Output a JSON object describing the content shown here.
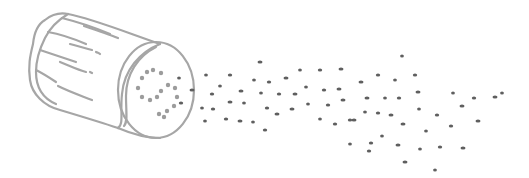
{
  "illustration": {
    "subject": "salt shaker sprinkling",
    "width": 529,
    "height": 178,
    "colors": {
      "background": "#ffffff",
      "outline": "#a6a6a6",
      "holes": "#9c9c9c",
      "grains": "#5f5f5f"
    }
  },
  "shaker": {
    "cap_center": [
      155,
      88
    ],
    "cap_rx": 40,
    "cap_ry": 49,
    "holes": [
      [
        147,
        72
      ],
      [
        153,
        70
      ],
      [
        161,
        73
      ],
      [
        142,
        78
      ],
      [
        138,
        88
      ],
      [
        142,
        97
      ],
      [
        150,
        100
      ],
      [
        157,
        97
      ],
      [
        161,
        91
      ],
      [
        168,
        85
      ],
      [
        175,
        88
      ],
      [
        177,
        97
      ],
      [
        174,
        106
      ],
      [
        167,
        111
      ],
      [
        159,
        114
      ],
      [
        164,
        117
      ]
    ]
  },
  "grains": [
    [
      179,
      78
    ],
    [
      181,
      103
    ],
    [
      192,
      90
    ],
    [
      206,
      75
    ],
    [
      230,
      75
    ],
    [
      260,
      62
    ],
    [
      254,
      80
    ],
    [
      269,
      82
    ],
    [
      286,
      78
    ],
    [
      300,
      70
    ],
    [
      320,
      70
    ],
    [
      341,
      69
    ],
    [
      220,
      86
    ],
    [
      212,
      94
    ],
    [
      241,
      91
    ],
    [
      261,
      93
    ],
    [
      279,
      94
    ],
    [
      295,
      94
    ],
    [
      306,
      87
    ],
    [
      324,
      90
    ],
    [
      339,
      89
    ],
    [
      202,
      108
    ],
    [
      213,
      109
    ],
    [
      230,
      102
    ],
    [
      244,
      103
    ],
    [
      267,
      108
    ],
    [
      292,
      109
    ],
    [
      308,
      104
    ],
    [
      328,
      105
    ],
    [
      343,
      100
    ],
    [
      205,
      121
    ],
    [
      226,
      119
    ],
    [
      240,
      121
    ],
    [
      253,
      122
    ],
    [
      265,
      130
    ],
    [
      277,
      114
    ],
    [
      320,
      119
    ],
    [
      335,
      124
    ],
    [
      354,
      120
    ],
    [
      402,
      56
    ],
    [
      378,
      75
    ],
    [
      361,
      82
    ],
    [
      395,
      80
    ],
    [
      415,
      75
    ],
    [
      367,
      98
    ],
    [
      385,
      98
    ],
    [
      399,
      98
    ],
    [
      418,
      92
    ],
    [
      453,
      93
    ],
    [
      474,
      98
    ],
    [
      495,
      97
    ],
    [
      365,
      112
    ],
    [
      378,
      113
    ],
    [
      391,
      115
    ],
    [
      419,
      109
    ],
    [
      437,
      115
    ],
    [
      462,
      106
    ],
    [
      502,
      93
    ],
    [
      350,
      120
    ],
    [
      403,
      124
    ],
    [
      426,
      131
    ],
    [
      451,
      126
    ],
    [
      478,
      121
    ],
    [
      382,
      136
    ],
    [
      371,
      143
    ],
    [
      398,
      145
    ],
    [
      420,
      149
    ],
    [
      440,
      147
    ],
    [
      463,
      148
    ],
    [
      350,
      144
    ],
    [
      369,
      151
    ],
    [
      405,
      162
    ],
    [
      435,
      170
    ]
  ]
}
